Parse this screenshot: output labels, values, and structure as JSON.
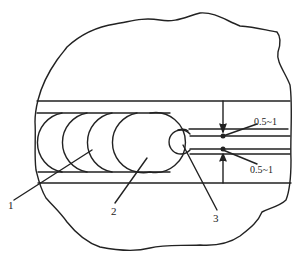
{
  "figure": {
    "type": "technical-cross-section",
    "stroke_color": "#222222",
    "background": "#ffffff"
  },
  "callouts": [
    {
      "id": "1",
      "label": "1"
    },
    {
      "id": "2",
      "label": "2"
    },
    {
      "id": "3",
      "label": "3"
    }
  ],
  "dimensions": {
    "upper": "0.5~1",
    "lower": "0.5~1"
  }
}
